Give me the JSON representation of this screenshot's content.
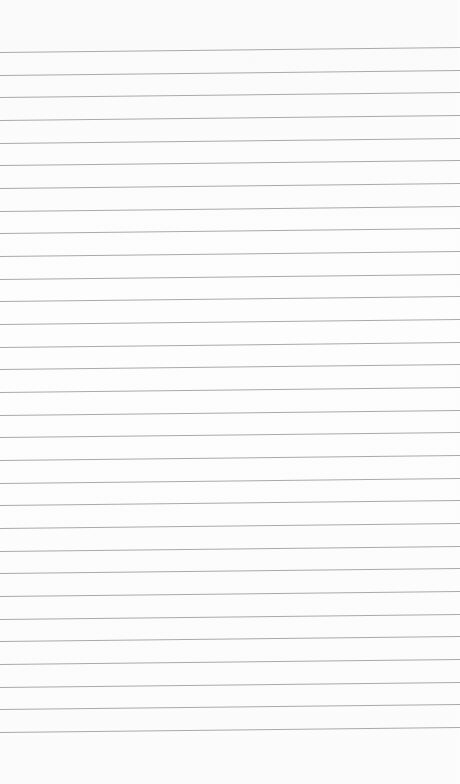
{
  "paper": {
    "type": "lined-paper",
    "background_color": "#fcfcfc",
    "rule_color": "#a9a9a9",
    "rule_count": 31,
    "first_rule_y_left": 52,
    "rule_spacing": 22.67,
    "tilt_rise_px": 5
  }
}
